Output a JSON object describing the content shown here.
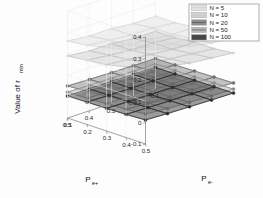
{
  "figure": {
    "background_color": "#fdfdfd",
    "axis_color": "#6e6e6e",
    "text_color": "#1a1a1a"
  },
  "axes": {
    "vertical": {
      "label_main": "Value of r",
      "label_sub": "min",
      "name": "Value of r_min",
      "ticks": [
        "0.4",
        "0.3",
        "0.2",
        "0.1",
        "0",
        "-0.1"
      ],
      "tick_values": [
        0.4,
        0.3,
        0.2,
        0.1,
        0.0,
        -0.1
      ],
      "range": [
        -0.1,
        0.4
      ]
    },
    "left_depth": {
      "label_main": "P",
      "label_sub": "e+",
      "name": "P_e+",
      "ticks": [
        "0.5",
        "0.4",
        "0.3",
        "0.2",
        "0.1"
      ],
      "tick_values": [
        0.5,
        0.4,
        0.3,
        0.2,
        0.1
      ],
      "range": [
        0.5,
        0.1
      ]
    },
    "right_depth": {
      "label_main": "P",
      "label_sub": "e-",
      "name": "P_e-",
      "ticks": [
        "0.5",
        "0.4",
        "0.3",
        "0.2",
        "0.1"
      ],
      "tick_values": [
        0.5,
        0.4,
        0.3,
        0.2,
        0.1
      ],
      "range": [
        0.5,
        0.1
      ]
    }
  },
  "legend": {
    "border_color": "#7a7a7a",
    "background_color": "#ffffff",
    "entries": [
      {
        "label": "N = 5",
        "n": 5,
        "color": "#e4e4e4"
      },
      {
        "label": "N = 10",
        "n": 10,
        "color": "#d2d2d2"
      },
      {
        "label": "N = 20",
        "n": 20,
        "color": "#8f8f8f"
      },
      {
        "label": "N = 50",
        "n": 50,
        "color": "#b9b9b9"
      },
      {
        "label": "N = 100",
        "n": 100,
        "color": "#4b4b4b"
      }
    ]
  },
  "chart_data": {
    "type": "surface",
    "title": "",
    "xlabel": "P_e+",
    "ylabel": "P_e-",
    "zlabel": "Value of r_min",
    "grid": true,
    "legend_position": "top-right",
    "zlim": [
      -0.1,
      0.4
    ],
    "xlim": [
      0.5,
      0.1
    ],
    "ylim": [
      0.5,
      0.1
    ],
    "x": [
      0.5,
      0.4,
      0.3,
      0.2,
      0.1
    ],
    "y": [
      0.5,
      0.4,
      0.3,
      0.2,
      0.1
    ],
    "series": [
      {
        "name": "N = 5",
        "n": 5,
        "color": "#e4e4e4",
        "edge_color": "#d8d8d8",
        "z": [
          [
            0.34,
            0.31,
            0.29,
            0.27,
            0.26
          ],
          [
            0.31,
            0.29,
            0.27,
            0.26,
            0.25
          ],
          [
            0.29,
            0.27,
            0.26,
            0.25,
            0.25
          ],
          [
            0.27,
            0.26,
            0.25,
            0.25,
            0.24
          ],
          [
            0.26,
            0.25,
            0.25,
            0.24,
            0.24
          ]
        ]
      },
      {
        "name": "N = 10",
        "n": 10,
        "color": "#d2d2d2",
        "edge_color": "#c6c6c6",
        "z": [
          [
            0.25,
            0.23,
            0.21,
            0.2,
            0.19
          ],
          [
            0.23,
            0.21,
            0.2,
            0.19,
            0.18
          ],
          [
            0.21,
            0.2,
            0.19,
            0.18,
            0.18
          ],
          [
            0.2,
            0.19,
            0.18,
            0.18,
            0.17
          ],
          [
            0.19,
            0.18,
            0.18,
            0.17,
            0.17
          ]
        ]
      },
      {
        "name": "N = 20",
        "n": 20,
        "color": "#8f8f8f",
        "edge_color": "#707070",
        "z": [
          [
            0.085,
            0.072,
            0.062,
            0.055,
            0.05
          ],
          [
            0.072,
            0.062,
            0.055,
            0.05,
            0.047
          ],
          [
            0.062,
            0.055,
            0.05,
            0.047,
            0.045
          ],
          [
            0.055,
            0.05,
            0.047,
            0.045,
            0.043
          ],
          [
            0.05,
            0.047,
            0.045,
            0.043,
            0.042
          ]
        ]
      },
      {
        "name": "N = 50",
        "n": 50,
        "color": "#b9b9b9",
        "edge_color": "#8c8c8c",
        "z": [
          [
            0.04,
            0.032,
            0.027,
            0.023,
            0.021
          ],
          [
            0.032,
            0.027,
            0.023,
            0.021,
            0.019
          ],
          [
            0.027,
            0.023,
            0.021,
            0.019,
            0.018
          ],
          [
            0.023,
            0.021,
            0.019,
            0.018,
            0.017
          ],
          [
            0.021,
            0.019,
            0.018,
            0.017,
            0.017
          ]
        ]
      },
      {
        "name": "N = 100",
        "n": 100,
        "color": "#4b4b4b",
        "edge_color": "#2d2d2d",
        "z": [
          [
            0.012,
            0.008,
            0.006,
            0.004,
            0.003
          ],
          [
            0.008,
            0.006,
            0.004,
            0.003,
            0.002
          ],
          [
            0.006,
            0.004,
            0.003,
            0.002,
            0.002
          ],
          [
            0.004,
            0.003,
            0.002,
            0.002,
            0.001
          ],
          [
            0.003,
            0.002,
            0.002,
            0.001,
            0.001
          ]
        ]
      }
    ]
  }
}
